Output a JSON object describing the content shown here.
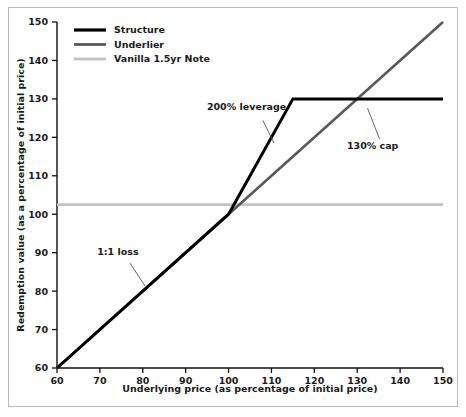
{
  "chart_data": {
    "type": "line",
    "title": "",
    "xlabel": "Underlying price (as percentage of initial price)",
    "ylabel": "Redemption value (as a percentage of initial price)",
    "xlim": [
      60,
      150
    ],
    "ylim": [
      60,
      150
    ],
    "xticks": [
      60,
      70,
      80,
      90,
      100,
      110,
      120,
      130,
      140,
      150
    ],
    "yticks": [
      60,
      70,
      80,
      90,
      100,
      110,
      120,
      130,
      140,
      150
    ],
    "xtick_labels": [
      "60",
      "70",
      "80",
      "90",
      "100",
      "110",
      "120",
      "130",
      "140",
      "150"
    ],
    "ytick_labels": [
      "60",
      "70",
      "80",
      "90",
      "100",
      "110",
      "120",
      "130",
      "140",
      "150"
    ],
    "grid": false,
    "legend_position": "top-left",
    "series": [
      {
        "name": "Structure",
        "color": "#000000",
        "width": 3.0,
        "points": [
          [
            60,
            60
          ],
          [
            100,
            100
          ],
          [
            115,
            130
          ],
          [
            150,
            130
          ]
        ]
      },
      {
        "name": "Underlier",
        "color": "#595959",
        "width": 2.6,
        "points": [
          [
            60,
            60
          ],
          [
            100,
            100
          ],
          [
            150,
            150
          ]
        ]
      },
      {
        "name": "Vanilla 1.5yr Note",
        "color": "#c4c4c4",
        "width": 2.6,
        "points": [
          [
            60,
            102.5
          ],
          [
            150,
            102.5
          ]
        ]
      }
    ],
    "annotations": [
      {
        "text": "200% leverage",
        "text_x": 104.2,
        "text_y": 127.0,
        "leader_from_x": 108.0,
        "leader_from_y": 124.4,
        "leader_to_x": 110.6,
        "leader_to_y": 118.5
      },
      {
        "text": "130% cap",
        "text_x": 133.6,
        "text_y": 117.0,
        "leader_from_x": 135.2,
        "leader_from_y": 119.6,
        "leader_to_x": 132.4,
        "leader_to_y": 127.6
      },
      {
        "text": "1:1 loss",
        "text_x": 74.2,
        "text_y": 89.5,
        "leader_from_x": 77.0,
        "leader_from_y": 87.3,
        "leader_to_x": 80.6,
        "leader_to_y": 81.2
      }
    ]
  },
  "legend": {
    "items": [
      {
        "label": "Structure",
        "color": "#000000"
      },
      {
        "label": "Underlier",
        "color": "#595959"
      },
      {
        "label": "Vanilla 1.5yr Note",
        "color": "#c4c4c4"
      }
    ]
  },
  "axes": {
    "x_title": "Underlying price (as percentage of initial price)",
    "y_title": "Redemption value (as a percentage of initial price)"
  }
}
